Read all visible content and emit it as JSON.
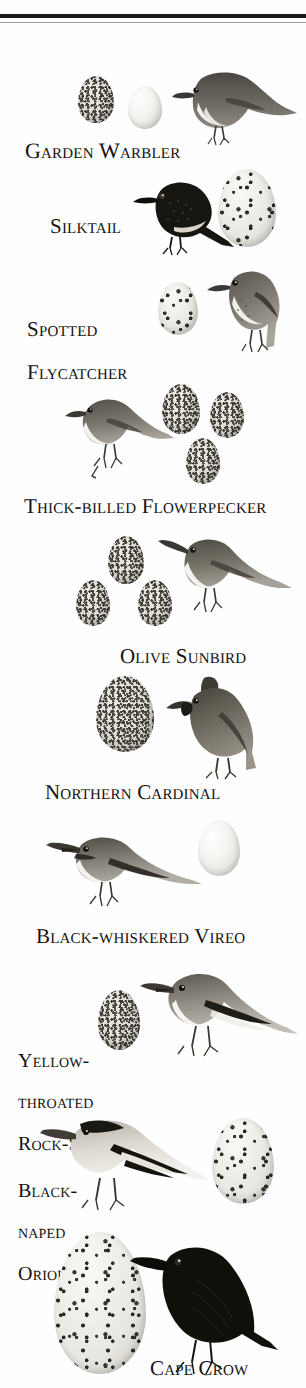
{
  "page": {
    "background_color": "#fefefe",
    "ink_color": "#15120f",
    "rule_color": "#1a1a1a",
    "rule_secondary_color": "#9a9a9a",
    "width": 306,
    "height": 1388
  },
  "header": {
    "has_double_rule": true
  },
  "entries": [
    {
      "id": "garden-warbler",
      "label": "Garden Warbler",
      "label_lines": [
        "Garden Warbler"
      ],
      "eggs": [
        {
          "pattern": "speckle-dense"
        },
        {
          "pattern": "plain"
        }
      ],
      "bird": "garden-warbler-bird"
    },
    {
      "id": "silktail",
      "label": "Silktail",
      "label_lines": [
        "Silktail"
      ],
      "eggs": [
        {
          "pattern": "speckle-bold"
        }
      ],
      "bird": "silktail-bird"
    },
    {
      "id": "spotted-flycatcher",
      "label": "Spotted Flycatcher",
      "label_lines": [
        "Spotted",
        "Flycatcher"
      ],
      "eggs": [
        {
          "pattern": "speckle-bold"
        }
      ],
      "bird": "spotted-flycatcher-bird"
    },
    {
      "id": "thick-billed-flowerpecker",
      "label": "Thick-billed Flowerpecker",
      "label_lines": [
        "Thick-billed Flowerpecker"
      ],
      "eggs": [
        {
          "pattern": "speckle-dense"
        },
        {
          "pattern": "speckle-dense"
        },
        {
          "pattern": "speckle-dense"
        }
      ],
      "bird": "thick-billed-flowerpecker-bird"
    },
    {
      "id": "olive-sunbird",
      "label": "Olive Sunbird",
      "label_lines": [
        "Olive Sunbird"
      ],
      "eggs": [
        {
          "pattern": "speckle-dense"
        },
        {
          "pattern": "speckle-dense"
        },
        {
          "pattern": "speckle-dense"
        }
      ],
      "bird": "olive-sunbird-bird"
    },
    {
      "id": "northern-cardinal",
      "label": "Northern Cardinal",
      "label_lines": [
        "Northern Cardinal"
      ],
      "eggs": [
        {
          "pattern": "speckle-dense"
        }
      ],
      "bird": "northern-cardinal-bird"
    },
    {
      "id": "black-whiskered-vireo",
      "label": "Black-whiskered Vireo",
      "label_lines": [
        "Black-whiskered Vireo"
      ],
      "eggs": [
        {
          "pattern": "plain"
        }
      ],
      "bird": "black-whiskered-vireo-bird"
    },
    {
      "id": "yellow-throated-rock-sparrow",
      "label": "Yellow-throated Rock-Sparrow",
      "label_lines": [
        "Yellow-",
        "throated",
        "Rock-Sparrow"
      ],
      "eggs": [
        {
          "pattern": "speckle-dense"
        }
      ],
      "bird": "yellow-throated-rock-sparrow-bird"
    },
    {
      "id": "black-naped-oriole",
      "label": "Black-naped Oriole",
      "label_lines": [
        "Black-",
        "naped",
        "Oriole"
      ],
      "eggs": [
        {
          "pattern": "speckle-bold"
        }
      ],
      "bird": "black-naped-oriole-bird"
    },
    {
      "id": "cape-crow",
      "label": "Cape Crow",
      "label_lines": [
        "Cape Crow"
      ],
      "eggs": [
        {
          "pattern": "speckle-dense"
        }
      ],
      "bird": "cape-crow-bird"
    }
  ]
}
